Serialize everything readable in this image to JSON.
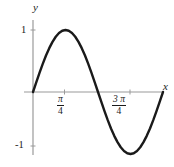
{
  "figure": {
    "background_color": "#ffffff",
    "curve_color": "#1a1a1a",
    "axis_color": "#9a9a9a",
    "text_color": "#1a1a1a"
  },
  "axes": {
    "x_title": "x",
    "y_title": "y",
    "x_ticks": [
      {
        "numerator": "π",
        "denominator": "4",
        "value": 0.7853981634
      },
      {
        "numerator": "3 π",
        "denominator": "4",
        "value": 2.3561944902
      }
    ],
    "y_ticks": [
      {
        "label": "1",
        "value": 1
      },
      {
        "label": "-1",
        "value": -1
      }
    ]
  },
  "chart_data": {
    "type": "line",
    "title": "",
    "xlabel": "x",
    "ylabel": "y",
    "xlim": [
      0,
      3.141592653589793
    ],
    "ylim": [
      -1,
      1
    ],
    "grid": false,
    "legend": null,
    "series": [
      {
        "name": "sin(2x)",
        "x": [
          0,
          0.0785,
          0.1571,
          0.2356,
          0.3142,
          0.3927,
          0.4712,
          0.5498,
          0.6283,
          0.7069,
          0.7854,
          0.8639,
          0.9425,
          1.021,
          1.0996,
          1.1781,
          1.2566,
          1.3352,
          1.4137,
          1.4923,
          1.5708,
          1.6493,
          1.7279,
          1.8064,
          1.885,
          1.9635,
          2.042,
          2.1206,
          2.1991,
          2.2777,
          2.3562,
          2.4347,
          2.5133,
          2.5918,
          2.6704,
          2.7489,
          2.8274,
          2.906,
          2.9845,
          3.0631,
          3.1416
        ],
        "y": [
          0,
          0.1564,
          0.309,
          0.454,
          0.5878,
          0.7071,
          0.809,
          0.891,
          0.9511,
          0.9877,
          1.0,
          0.9877,
          0.9511,
          0.891,
          0.809,
          0.7071,
          0.5878,
          0.454,
          0.309,
          0.1564,
          0,
          -0.1564,
          -0.309,
          -0.454,
          -0.5878,
          -0.7071,
          -0.809,
          -0.891,
          -0.9511,
          -0.9877,
          -1.0,
          -0.9877,
          -0.9511,
          -0.891,
          -0.809,
          -0.7071,
          -0.5878,
          -0.454,
          -0.309,
          -0.1564,
          0
        ]
      }
    ],
    "annotations": []
  }
}
